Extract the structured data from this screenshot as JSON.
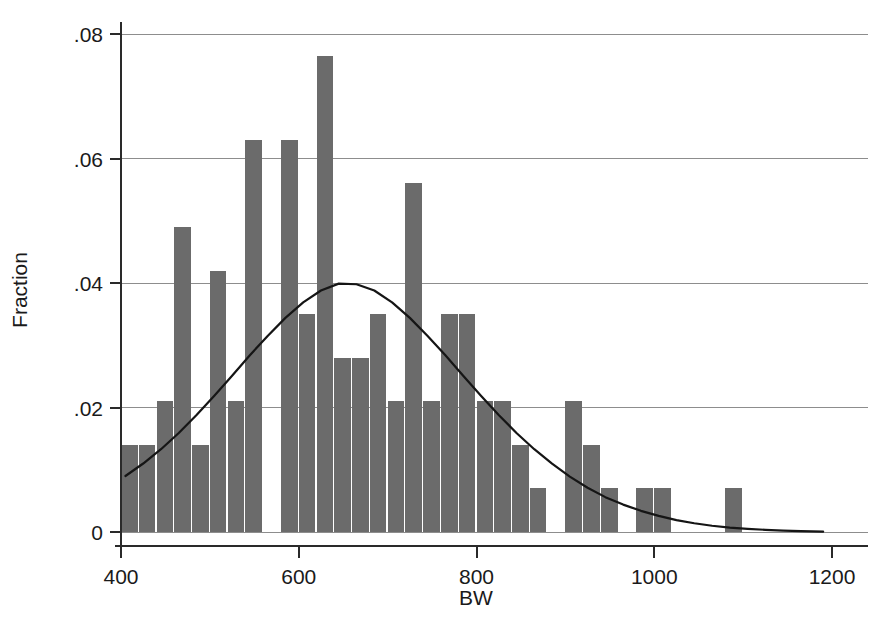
{
  "chart_data": {
    "type": "bar",
    "title": "",
    "subtitle": "",
    "xlabel": "BW",
    "ylabel": "Fraction",
    "xlim": [
      400,
      1200
    ],
    "ylim": [
      0,
      0.08
    ],
    "grid": true,
    "legend": null,
    "bin_width": 20,
    "x_ticks": [
      400,
      600,
      800,
      1000,
      1200
    ],
    "x_tick_labels": [
      "400",
      "600",
      "800",
      "1000",
      "1200"
    ],
    "y_ticks": [
      0,
      0.02,
      0.04,
      0.06,
      0.08
    ],
    "y_tick_labels": [
      "0",
      ".02",
      ".04",
      ".06",
      ".08"
    ],
    "bar_color": "#6b6b6b",
    "bar_edge_color": "#f2f2f2",
    "curve_color": "#151515",
    "axis_color": "#2a2a2a",
    "grid_color": "#8d8d8d",
    "categories": [
      410,
      430,
      450,
      470,
      490,
      510,
      530,
      550,
      570,
      590,
      610,
      630,
      650,
      670,
      690,
      710,
      730,
      750,
      770,
      790,
      810,
      830,
      850,
      870,
      890,
      910,
      930,
      950,
      970,
      990,
      1010,
      1030,
      1050,
      1070,
      1090
    ],
    "values": [
      0.014,
      0.014,
      0.021,
      0.049,
      0.014,
      0.042,
      0.021,
      0.063,
      0.0,
      0.063,
      0.035,
      0.0765,
      0.028,
      0.028,
      0.035,
      0.021,
      0.056,
      0.021,
      0.035,
      0.035,
      0.021,
      0.021,
      0.014,
      0.007,
      0.0,
      0.021,
      0.014,
      0.007,
      0.0,
      0.007,
      0.007,
      0.0,
      0.0,
      0.0,
      0.007
    ],
    "overlay": {
      "type": "line",
      "name": "normal density",
      "mean": 645,
      "peak_value": 0.0399,
      "x_start": 405,
      "x_end": 1190,
      "start_value": 0.009,
      "points_x": [
        405,
        425,
        445,
        465,
        485,
        505,
        525,
        545,
        565,
        585,
        605,
        625,
        645,
        665,
        685,
        705,
        725,
        745,
        765,
        785,
        805,
        825,
        845,
        865,
        885,
        905,
        925,
        945,
        965,
        985,
        1005,
        1025,
        1045,
        1065,
        1085,
        1105,
        1125,
        1145,
        1165,
        1190
      ],
      "points_y": [
        0.009,
        0.011,
        0.0133,
        0.0159,
        0.0188,
        0.0219,
        0.0251,
        0.0284,
        0.0315,
        0.0344,
        0.0369,
        0.0388,
        0.0399,
        0.0398,
        0.0388,
        0.0369,
        0.0344,
        0.0315,
        0.0284,
        0.0251,
        0.0219,
        0.0188,
        0.0159,
        0.0133,
        0.011,
        0.0089,
        0.0071,
        0.0056,
        0.0044,
        0.0034,
        0.0026,
        0.0019,
        0.0014,
        0.001,
        0.0007,
        0.0005,
        0.00035,
        0.00022,
        0.00014,
        6e-05
      ]
    }
  },
  "axes": {
    "y_label_text": "Fraction",
    "x_label_text": "BW"
  }
}
